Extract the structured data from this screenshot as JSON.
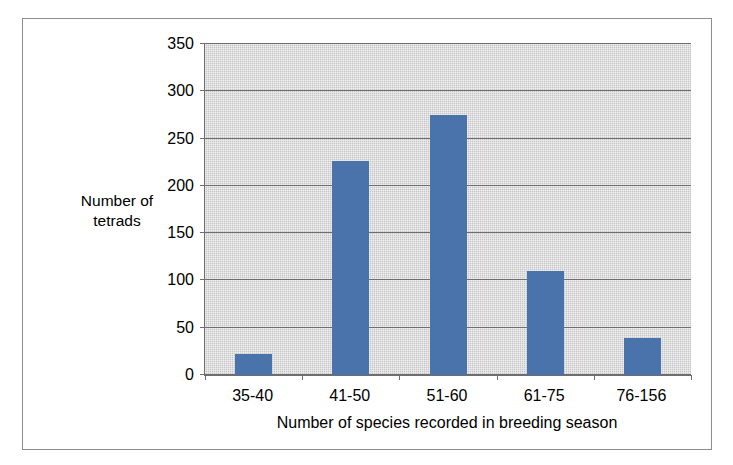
{
  "chart_data": {
    "type": "bar",
    "title": "",
    "subtitle": "",
    "categories": [
      "35-40",
      "41-50",
      "51-60",
      "61-75",
      "76-156"
    ],
    "values": [
      22,
      226,
      275,
      110,
      39
    ],
    "xlabel": "Number of species recorded in breeding season",
    "ylabel": "Number of\ntetrads",
    "ylim": [
      0,
      350
    ],
    "yticks": [
      0,
      50,
      100,
      150,
      200,
      250,
      300,
      350
    ],
    "ytick_labels": [
      "0",
      "50",
      "100",
      "150",
      "200",
      "250",
      "300",
      "350"
    ],
    "grid": "horizontal",
    "legend": "none",
    "series": [
      {
        "name": "Number of tetrads",
        "values": [
          22,
          226,
          275,
          110,
          39
        ],
        "color": "#4a72ab"
      }
    ],
    "annotations": []
  },
  "style": {
    "bar_color": "#4a72ab",
    "plot_background": "#c6c6c6",
    "gridline_color": "#6e6e6e",
    "axis_color": "#6e6e6e",
    "frame_color": "#8d8d8d",
    "page_background": "#ffffff",
    "text_color": "#000000"
  }
}
